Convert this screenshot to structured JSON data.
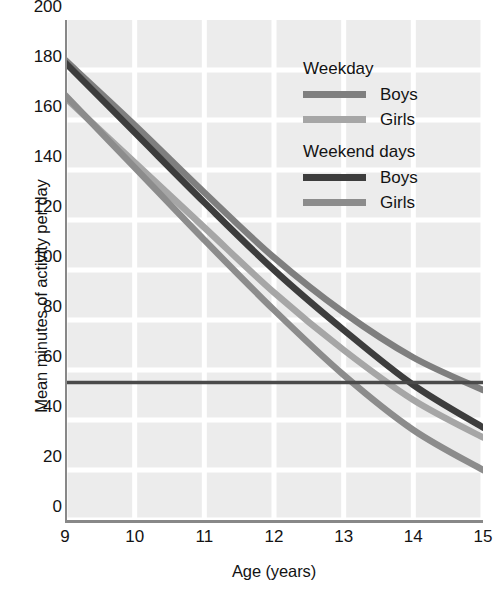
{
  "chart_data": {
    "type": "line",
    "title": "",
    "xlabel": "Age (years)",
    "ylabel": "Mean minutes of activity per day",
    "xlim": [
      9,
      15
    ],
    "ylim": [
      0,
      200
    ],
    "grid": true,
    "legend_position": "top-right",
    "x": [
      9,
      10,
      11,
      12,
      13,
      14,
      15
    ],
    "xticklabels": [
      "9",
      "10",
      "11",
      "12",
      "13",
      "14",
      "15"
    ],
    "yticklabels": [
      "0",
      "20",
      "40",
      "60",
      "80",
      "100",
      "120",
      "140",
      "160",
      "180",
      "200"
    ],
    "yticks": [
      0,
      20,
      40,
      60,
      80,
      100,
      120,
      140,
      160,
      180,
      200
    ],
    "series": [
      {
        "name": "Weekday Boys",
        "group": "Weekday",
        "sex": "Boys",
        "color": "#7f7f7f",
        "values": [
          184,
          158,
          131,
          105,
          83,
          65,
          52
        ]
      },
      {
        "name": "Weekday Girls",
        "group": "Weekday",
        "sex": "Girls",
        "color": "#a6a6a6",
        "values": [
          169,
          143,
          117,
          91,
          68,
          48,
          33
        ]
      },
      {
        "name": "Weekend days Boys",
        "group": "Weekend days",
        "sex": "Boys",
        "color": "#3d3d3d",
        "values": [
          183,
          155,
          127,
          100,
          76,
          54,
          37
        ]
      },
      {
        "name": "Weekend days Girls",
        "group": "Weekend days",
        "sex": "Girls",
        "color": "#8c8c8c",
        "values": [
          170,
          141,
          112,
          84,
          58,
          36,
          20
        ]
      }
    ],
    "reference_line": {
      "value": 55,
      "color": "#4a4a4a",
      "orientation": "horizontal"
    },
    "annotations": []
  },
  "legend": {
    "groups": [
      {
        "heading": "Weekday",
        "entries": [
          {
            "label": "Boys",
            "color": "#7f7f7f"
          },
          {
            "label": "Girls",
            "color": "#a6a6a6"
          }
        ]
      },
      {
        "heading": "Weekend days",
        "entries": [
          {
            "label": "Boys",
            "color": "#3d3d3d"
          },
          {
            "label": "Girls",
            "color": "#8c8c8c"
          }
        ]
      }
    ]
  },
  "colors": {
    "plot_background": "#ececec",
    "gridline": "#ffffff",
    "axis": "#888888",
    "text": "#131313"
  }
}
